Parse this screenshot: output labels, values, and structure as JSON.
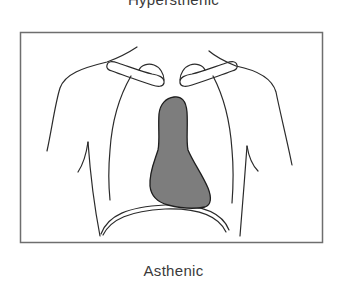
{
  "figure": {
    "top_caption": "Hypersthenic",
    "bottom_caption": "Asthenic",
    "frame": {
      "x": 20,
      "y": 32,
      "width": 303,
      "height": 211
    },
    "colors": {
      "frame_stroke": "#6e6e6e",
      "line_stroke": "#2b2b2b",
      "heart_fill": "#7d7d7d",
      "heart_stroke": "#1e1e1e",
      "background": "#ffffff",
      "text": "#3a3a3a"
    },
    "parts": [
      "torso-outline",
      "clavicles",
      "rib-cage-lines",
      "heart-silhouette",
      "diaphragm"
    ]
  }
}
